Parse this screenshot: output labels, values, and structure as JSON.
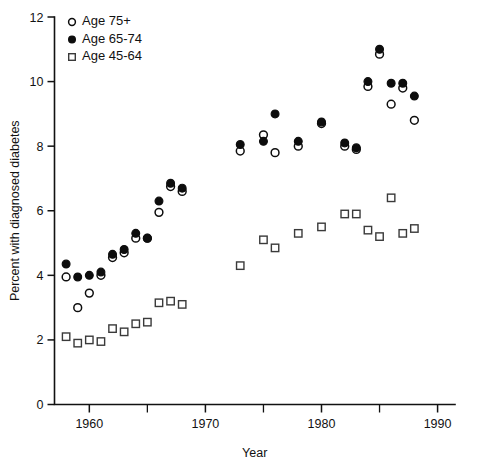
{
  "chart_data": {
    "type": "scatter",
    "title": "",
    "xlabel": "Year",
    "ylabel": "Percent with diagnosed diabetes",
    "xlim": [
      1957,
      1991.5
    ],
    "ylim": [
      0,
      12
    ],
    "xticks": [
      1960,
      1970,
      1980,
      1990
    ],
    "xtick_labels": [
      "1960",
      "1970",
      "1980",
      "1990"
    ],
    "xticks_minor": [
      1965,
      1975,
      1985
    ],
    "yticks": [
      0,
      2,
      4,
      6,
      8,
      10,
      12
    ],
    "ytick_labels": [
      "0",
      "2",
      "4",
      "6",
      "8",
      "10",
      "12"
    ],
    "grid": false,
    "legend_position": "top-left",
    "series": [
      {
        "name": "Age 75+",
        "marker": "open-circle",
        "color": "#0d0d0d",
        "points": [
          {
            "x": 1958,
            "y": 3.95
          },
          {
            "x": 1959,
            "y": 3.0
          },
          {
            "x": 1960,
            "y": 3.45
          },
          {
            "x": 1961,
            "y": 4.0
          },
          {
            "x": 1962,
            "y": 4.55
          },
          {
            "x": 1963,
            "y": 4.7
          },
          {
            "x": 1964,
            "y": 5.15
          },
          {
            "x": 1965,
            "y": 5.15
          },
          {
            "x": 1966,
            "y": 5.95
          },
          {
            "x": 1967,
            "y": 6.75
          },
          {
            "x": 1968,
            "y": 6.6
          },
          {
            "x": 1973,
            "y": 7.85
          },
          {
            "x": 1975,
            "y": 8.35
          },
          {
            "x": 1976,
            "y": 7.8
          },
          {
            "x": 1978,
            "y": 8.0
          },
          {
            "x": 1980,
            "y": 8.7
          },
          {
            "x": 1982,
            "y": 8.0
          },
          {
            "x": 1983,
            "y": 7.9
          },
          {
            "x": 1984,
            "y": 9.85
          },
          {
            "x": 1985,
            "y": 10.85
          },
          {
            "x": 1986,
            "y": 9.3
          },
          {
            "x": 1987,
            "y": 9.8
          },
          {
            "x": 1988,
            "y": 8.8
          }
        ]
      },
      {
        "name": "Age 65-74",
        "marker": "filled-circle",
        "color": "#0d0d0d",
        "points": [
          {
            "x": 1958,
            "y": 4.35
          },
          {
            "x": 1959,
            "y": 3.95
          },
          {
            "x": 1960,
            "y": 4.0
          },
          {
            "x": 1961,
            "y": 4.1
          },
          {
            "x": 1962,
            "y": 4.65
          },
          {
            "x": 1963,
            "y": 4.8
          },
          {
            "x": 1964,
            "y": 5.3
          },
          {
            "x": 1965,
            "y": 5.15
          },
          {
            "x": 1966,
            "y": 6.3
          },
          {
            "x": 1967,
            "y": 6.85
          },
          {
            "x": 1968,
            "y": 6.7
          },
          {
            "x": 1973,
            "y": 8.05
          },
          {
            "x": 1975,
            "y": 8.15
          },
          {
            "x": 1976,
            "y": 9.0
          },
          {
            "x": 1978,
            "y": 8.15
          },
          {
            "x": 1980,
            "y": 8.75
          },
          {
            "x": 1982,
            "y": 8.1
          },
          {
            "x": 1983,
            "y": 7.95
          },
          {
            "x": 1984,
            "y": 10.0
          },
          {
            "x": 1985,
            "y": 11.0
          },
          {
            "x": 1986,
            "y": 9.95
          },
          {
            "x": 1987,
            "y": 9.95
          },
          {
            "x": 1988,
            "y": 9.55
          }
        ]
      },
      {
        "name": "Age 45-64",
        "marker": "open-square",
        "color": "#3a3a3a",
        "points": [
          {
            "x": 1958,
            "y": 2.1
          },
          {
            "x": 1959,
            "y": 1.9
          },
          {
            "x": 1960,
            "y": 2.0
          },
          {
            "x": 1961,
            "y": 1.95
          },
          {
            "x": 1962,
            "y": 2.35
          },
          {
            "x": 1963,
            "y": 2.25
          },
          {
            "x": 1964,
            "y": 2.5
          },
          {
            "x": 1965,
            "y": 2.55
          },
          {
            "x": 1966,
            "y": 3.15
          },
          {
            "x": 1967,
            "y": 3.2
          },
          {
            "x": 1968,
            "y": 3.1
          },
          {
            "x": 1973,
            "y": 4.3
          },
          {
            "x": 1975,
            "y": 5.1
          },
          {
            "x": 1976,
            "y": 4.85
          },
          {
            "x": 1978,
            "y": 5.3
          },
          {
            "x": 1980,
            "y": 5.5
          },
          {
            "x": 1982,
            "y": 5.9
          },
          {
            "x": 1983,
            "y": 5.9
          },
          {
            "x": 1984,
            "y": 5.4
          },
          {
            "x": 1985,
            "y": 5.2
          },
          {
            "x": 1986,
            "y": 6.4
          },
          {
            "x": 1987,
            "y": 5.3
          },
          {
            "x": 1988,
            "y": 5.45
          }
        ]
      }
    ],
    "legend": [
      {
        "label": "Age 75+",
        "marker": "open-circle"
      },
      {
        "label": "Age 65-74",
        "marker": "filled-circle"
      },
      {
        "label": "Age 45-64",
        "marker": "open-square"
      }
    ]
  }
}
